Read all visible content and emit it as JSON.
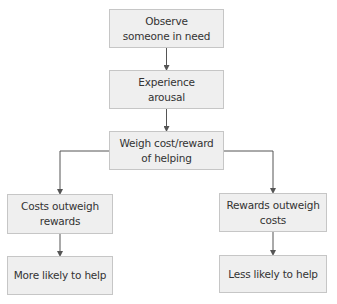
{
  "diagram": {
    "type": "flowchart",
    "nodes": [
      {
        "id": "observe",
        "label": "Observe\nsomeone in need"
      },
      {
        "id": "arousal",
        "label": "Experience\narousal"
      },
      {
        "id": "weigh",
        "label": "Weigh cost/reward\nof helping"
      },
      {
        "id": "costs",
        "label": "Costs outweigh\nrewards"
      },
      {
        "id": "rewards",
        "label": "Rewards outweigh\ncosts"
      },
      {
        "id": "more",
        "label": "More likely to help"
      },
      {
        "id": "less",
        "label": "Less likely to help"
      }
    ],
    "edges": [
      {
        "from": "observe",
        "to": "arousal"
      },
      {
        "from": "arousal",
        "to": "weigh"
      },
      {
        "from": "weigh",
        "to": "costs"
      },
      {
        "from": "weigh",
        "to": "rewards"
      },
      {
        "from": "costs",
        "to": "more"
      },
      {
        "from": "rewards",
        "to": "less"
      }
    ],
    "colors": {
      "box_fill": "#efefef",
      "box_border": "#c6c6c6",
      "line": "#555555",
      "text": "#333333"
    }
  }
}
